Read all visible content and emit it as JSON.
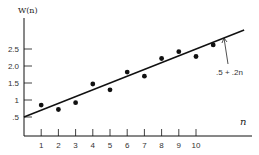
{
  "chart_data": {
    "type": "scatter",
    "title": "",
    "xlabel": "n",
    "ylabel": "W(n)",
    "x_ticks": [
      "1",
      "2",
      "3",
      "4",
      "5",
      "6",
      "7",
      "8",
      "9",
      "10"
    ],
    "y_ticks": [
      ".5",
      "1",
      "1.5",
      "2.0",
      "2.5"
    ],
    "y_tick_values": [
      0.5,
      1,
      1.5,
      2.0,
      2.5
    ],
    "xlim": [
      0,
      13
    ],
    "ylim": [
      0,
      3.0
    ],
    "grid": false,
    "series": [
      {
        "name": "observations",
        "type": "scatter",
        "x": [
          1,
          2,
          3,
          4,
          5,
          6,
          7,
          8,
          9,
          10,
          11
        ],
        "y": [
          0.85,
          0.72,
          0.92,
          1.47,
          1.3,
          1.82,
          1.7,
          2.22,
          2.42,
          2.28,
          2.62
        ]
      },
      {
        "name": "fitted line",
        "type": "line",
        "equation": ".5 + .2n",
        "intercept": 0.5,
        "slope": 0.2,
        "x": [
          0,
          12.8
        ],
        "y": [
          0.5,
          3.06
        ]
      }
    ],
    "annotations": [
      {
        "text": ".5 + .2n",
        "points_to": "fitted line"
      }
    ]
  },
  "labels": {
    "y_axis_title": "W(n)",
    "x_axis_title": "n",
    "line_annotation": ".5 + .2n"
  },
  "colors": {
    "ink": "#111111",
    "background": "#ffffff"
  }
}
